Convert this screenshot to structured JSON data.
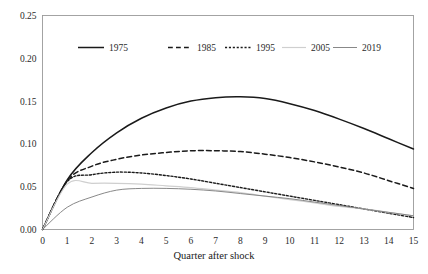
{
  "chart_data": {
    "type": "line",
    "title": "",
    "subtitle": "",
    "xlabel": "Quarter after shock",
    "ylabel": "",
    "xlim": [
      0,
      15
    ],
    "ylim": [
      0.0,
      0.25
    ],
    "grid": false,
    "legend_position": "top-center",
    "x": [
      0,
      1,
      2,
      3,
      4,
      5,
      6,
      7,
      8,
      9,
      10,
      11,
      12,
      13,
      14,
      15
    ],
    "xticks": [
      "0",
      "1",
      "2",
      "3",
      "4",
      "5",
      "6",
      "7",
      "8",
      "9",
      "10",
      "11",
      "12",
      "13",
      "14",
      "15"
    ],
    "yticks": [
      "0.00",
      "0.05",
      "0.10",
      "0.15",
      "0.20",
      "0.25"
    ],
    "ytick_values": [
      0.0,
      0.05,
      0.1,
      0.15,
      0.2,
      0.25
    ],
    "series": [
      {
        "name": "1975",
        "style": "solid",
        "color": "#1a1a1a",
        "width": 1.5,
        "values": [
          0.0,
          0.058,
          0.09,
          0.113,
          0.13,
          0.142,
          0.15,
          0.154,
          0.155,
          0.153,
          0.147,
          0.139,
          0.129,
          0.118,
          0.106,
          0.094
        ]
      },
      {
        "name": "1985",
        "style": "dashed",
        "color": "#1a1a1a",
        "width": 1.5,
        "values": [
          0.0,
          0.057,
          0.074,
          0.082,
          0.087,
          0.09,
          0.092,
          0.092,
          0.091,
          0.088,
          0.084,
          0.079,
          0.073,
          0.066,
          0.057,
          0.048
        ]
      },
      {
        "name": "1995",
        "style": "dotted",
        "color": "#1a1a1a",
        "width": 1.4,
        "values": [
          0.0,
          0.056,
          0.064,
          0.067,
          0.066,
          0.063,
          0.059,
          0.054,
          0.049,
          0.044,
          0.039,
          0.034,
          0.029,
          0.024,
          0.019,
          0.014
        ]
      },
      {
        "name": "2005",
        "style": "solid",
        "color": "#cfcfcf",
        "width": 1.2,
        "values": [
          0.0,
          0.053,
          0.054,
          0.054,
          0.053,
          0.051,
          0.049,
          0.046,
          0.043,
          0.039,
          0.035,
          0.031,
          0.027,
          0.024,
          0.02,
          0.016
        ]
      },
      {
        "name": "2019",
        "style": "solid",
        "color": "#7a7a7a",
        "width": 0.9,
        "values": [
          0.0,
          0.026,
          0.038,
          0.046,
          0.048,
          0.048,
          0.047,
          0.045,
          0.042,
          0.039,
          0.036,
          0.032,
          0.028,
          0.024,
          0.02,
          0.016
        ]
      }
    ]
  },
  "axes": {
    "x_title": "Quarter after shock"
  },
  "legend": {
    "entries": [
      {
        "label": "1975"
      },
      {
        "label": "1985"
      },
      {
        "label": "1995"
      },
      {
        "label": "2005"
      },
      {
        "label": "2019"
      }
    ]
  }
}
